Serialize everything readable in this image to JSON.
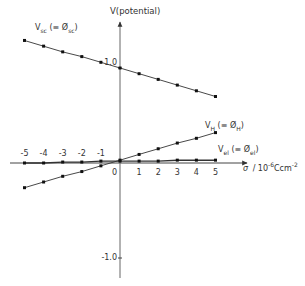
{
  "chart_data": {
    "type": "line",
    "title": "",
    "ylabel": "V(potential)",
    "xlabel": "σ / 10⁻⁶ C cm⁻²",
    "xlabel_parts": {
      "sym": "σ",
      "unit": "/ 10",
      "exp": "-6",
      "unit2": "Ccm",
      "exp2": "-2"
    },
    "xlim": [
      -5.5,
      6.5
    ],
    "ylim": [
      -1.2,
      1.45
    ],
    "x_ticks": [
      -5,
      -4,
      -3,
      -2,
      -1,
      0,
      1,
      2,
      3,
      4,
      5
    ],
    "x_tick_labels": [
      "-5",
      "-4",
      "-3",
      "-2",
      "-1",
      "0",
      "1",
      "2",
      "3",
      "4",
      "5"
    ],
    "y_ticks": [
      1.0,
      -1.0
    ],
    "y_tick_labels": [
      "1.0",
      "-1.0"
    ],
    "grid": false,
    "legend": "inline labels",
    "series": [
      {
        "name": "V_sc (≡ Ø_sc)",
        "label_main": "V",
        "label_sub": "sc",
        "label_eq": "(≡ Ø",
        "label_eq_sub": "sc",
        "label_close": ")",
        "x": [
          -5,
          -4,
          -3,
          -2,
          -1,
          0,
          1,
          2,
          3,
          4,
          5
        ],
        "values": [
          1.29,
          1.23,
          1.17,
          1.12,
          1.06,
          1.0,
          0.94,
          0.88,
          0.82,
          0.76,
          0.7
        ]
      },
      {
        "name": "V_H (≡ Ø_H)",
        "label_main": "V",
        "label_sub": "H",
        "label_eq": "(≡ Ø",
        "label_eq_sub": "H",
        "label_close": ")",
        "x": [
          -5,
          -4,
          -3,
          -2,
          -1,
          0,
          1,
          2,
          3,
          4,
          5
        ],
        "values": [
          -0.26,
          -0.2,
          -0.14,
          -0.09,
          -0.03,
          0.03,
          0.09,
          0.15,
          0.21,
          0.26,
          0.32
        ]
      },
      {
        "name": "V_el (≡ Ø_el)",
        "label_main": "V",
        "label_sub": "el",
        "label_eq": "(≡ Ø",
        "label_eq_sub": "el",
        "label_close": ")",
        "x": [
          -5,
          -4,
          -3,
          -2,
          -1,
          0,
          1,
          2,
          3,
          4,
          5
        ],
        "values": [
          0.0,
          0.0,
          0.01,
          0.01,
          0.02,
          0.02,
          0.02,
          0.02,
          0.03,
          0.03,
          0.03
        ]
      }
    ],
    "annotations": [
      "V(potential)",
      "1.0",
      "-1.0",
      "0"
    ]
  },
  "colors": {
    "axis": "#444444",
    "line": "#333333",
    "marker": "#111111",
    "text": "#333333"
  }
}
